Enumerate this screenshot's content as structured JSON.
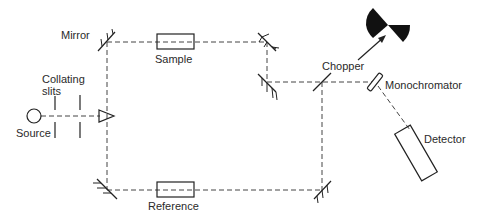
{
  "diagram": {
    "labels": {
      "mirror": "Mirror",
      "sample": "Sample",
      "collating_slits_line1": "Collating",
      "collating_slits_line2": "slits",
      "source": "Source",
      "reference": "Reference",
      "chopper": "Chopper",
      "monochromator": "Monochromator",
      "detector": "Detector"
    },
    "colors": {
      "line": "#222222",
      "beam": "#444444",
      "chopper_fill": "#111111",
      "background": "#ffffff"
    },
    "components": [
      {
        "id": "source",
        "shape": "circle"
      },
      {
        "id": "collating-slits",
        "shape": "two vertical lines"
      },
      {
        "id": "prism",
        "shape": "triangle"
      },
      {
        "id": "mirror-top-left",
        "shape": "hatched mirror"
      },
      {
        "id": "sample",
        "shape": "rectangle"
      },
      {
        "id": "mirror-top-right",
        "shape": "hatched mirror"
      },
      {
        "id": "mirror-mid-right",
        "shape": "hatched mirror"
      },
      {
        "id": "mirror-bottom-left",
        "shape": "hatched mirror"
      },
      {
        "id": "reference",
        "shape": "rectangle"
      },
      {
        "id": "mirror-bottom-right",
        "shape": "hatched mirror"
      },
      {
        "id": "chopper",
        "shape": "beam combiner / rotating sector"
      },
      {
        "id": "monochromator",
        "shape": "slanted bar"
      },
      {
        "id": "detector",
        "shape": "rotated rectangle"
      }
    ]
  }
}
